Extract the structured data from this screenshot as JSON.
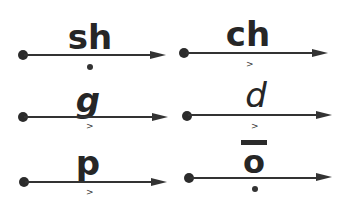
{
  "diagram": {
    "cells": [
      {
        "label": "sh",
        "mark": "dot"
      },
      {
        "label": "ch",
        "mark": ">"
      },
      {
        "label": "g",
        "mark": ">"
      },
      {
        "label": "d",
        "mark": ">"
      },
      {
        "label": "p",
        "mark": ">"
      },
      {
        "label": "o",
        "mark": "dot",
        "macron": true
      }
    ],
    "caret": ">"
  }
}
